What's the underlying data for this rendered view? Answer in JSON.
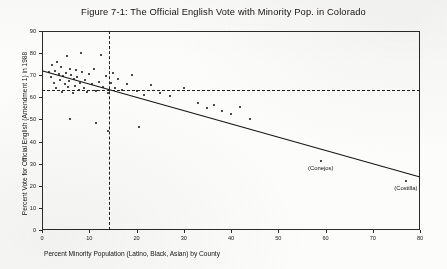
{
  "figure": {
    "title": "Figure 7-1:  The Official English Vote with Minority Pop. in Colorado"
  },
  "chart_data": {
    "type": "scatter",
    "title": "Figure 7-1:  The Official English Vote with Minority Pop. in Colorado",
    "xlabel": "Percent Minority Population (Latino, Black, Asian) by County",
    "ylabel": "Percent Vote for Official English (Amendment 1) in 1988",
    "xlim": [
      0,
      80
    ],
    "ylim": [
      0,
      90
    ],
    "xticks": [
      0,
      10,
      20,
      30,
      40,
      50,
      60,
      70,
      80
    ],
    "yticks": [
      0,
      10,
      20,
      30,
      40,
      50,
      60,
      70,
      80,
      90
    ],
    "grid": false,
    "legend": false,
    "points": [
      [
        1.5,
        71.5
      ],
      [
        2.0,
        69.0
      ],
      [
        2.2,
        74.5
      ],
      [
        2.5,
        66.5
      ],
      [
        2.8,
        72.0
      ],
      [
        3.0,
        64.0
      ],
      [
        3.2,
        76.0
      ],
      [
        3.5,
        70.5
      ],
      [
        3.8,
        68.0
      ],
      [
        4.0,
        73.5
      ],
      [
        4.2,
        62.5
      ],
      [
        4.5,
        69.5
      ],
      [
        4.8,
        66.0
      ],
      [
        5.0,
        71.0
      ],
      [
        5.2,
        78.5
      ],
      [
        5.5,
        64.5
      ],
      [
        5.8,
        67.5
      ],
      [
        6.0,
        73.0
      ],
      [
        6.2,
        70.0
      ],
      [
        6.5,
        62.0
      ],
      [
        6.8,
        68.5
      ],
      [
        7.0,
        65.0
      ],
      [
        7.2,
        72.5
      ],
      [
        7.5,
        69.0
      ],
      [
        7.8,
        63.5
      ],
      [
        8.0,
        66.5
      ],
      [
        8.2,
        80.0
      ],
      [
        8.5,
        71.5
      ],
      [
        8.8,
        64.0
      ],
      [
        9.0,
        68.0
      ],
      [
        9.5,
        62.5
      ],
      [
        10.0,
        70.5
      ],
      [
        10.5,
        66.0
      ],
      [
        11.0,
        73.0
      ],
      [
        11.5,
        63.0
      ],
      [
        12.0,
        67.0
      ],
      [
        12.5,
        79.0
      ],
      [
        13.0,
        64.5
      ],
      [
        13.5,
        69.5
      ],
      [
        14.0,
        62.0
      ],
      [
        14.5,
        66.5
      ],
      [
        15.0,
        71.0
      ],
      [
        15.5,
        64.0
      ],
      [
        16.0,
        68.5
      ],
      [
        17.0,
        63.5
      ],
      [
        18.0,
        66.0
      ],
      [
        19.0,
        70.0
      ],
      [
        20.0,
        63.0
      ],
      [
        21.5,
        61.0
      ],
      [
        23.0,
        65.5
      ],
      [
        25.0,
        62.0
      ],
      [
        27.0,
        60.5
      ],
      [
        30.0,
        64.0
      ],
      [
        33.0,
        57.5
      ],
      [
        35.0,
        55.0
      ],
      [
        36.5,
        56.5
      ],
      [
        38.0,
        54.0
      ],
      [
        40.0,
        52.5
      ],
      [
        42.0,
        55.5
      ],
      [
        44.0,
        50.0
      ],
      [
        6.0,
        50.0
      ],
      [
        11.5,
        48.5
      ],
      [
        14.0,
        45.0
      ],
      [
        20.5,
        46.5
      ],
      [
        59.0,
        31.0
      ],
      [
        77.0,
        22.0
      ]
    ],
    "regression_line": {
      "x": [
        0,
        80
      ],
      "y": [
        72.0,
        24.0
      ],
      "style": "solid"
    },
    "reference_lines": [
      {
        "orientation": "vertical",
        "value": 14.2,
        "style": "dashed"
      },
      {
        "orientation": "horizontal",
        "value": 63.5,
        "style": "dashed"
      }
    ],
    "annotations": [
      {
        "label": "(Conejos)",
        "x": 59.0,
        "y": 31.0
      },
      {
        "label": "(Costilla)",
        "x": 77.0,
        "y": 22.0
      }
    ]
  }
}
